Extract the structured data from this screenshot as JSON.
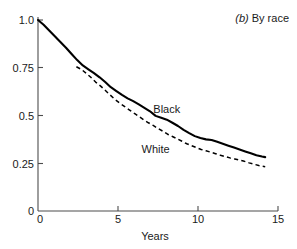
{
  "chart_data": {
    "type": "line",
    "title_prefix": "(b)",
    "title_text": "By race",
    "xlabel": "Years",
    "ylabel": "",
    "xlim": [
      0,
      15
    ],
    "ylim": [
      0,
      1.0
    ],
    "xticks": [
      0,
      5,
      10,
      15
    ],
    "xticklabels": [
      "0",
      "5",
      "10",
      "15"
    ],
    "yticks": [
      0,
      0.25,
      0.5,
      0.75,
      1.0
    ],
    "yticklabels": [
      "0",
      "0.25",
      "0.5",
      "0.75",
      "1.0"
    ],
    "grid": false,
    "legend_position": "inline-annotation",
    "series": [
      {
        "name": "Black",
        "style": "solid",
        "color": "#000000",
        "label_x": 8.05,
        "label_y": 0.512,
        "x": [
          0.0,
          0.35,
          0.7,
          1.05,
          1.4,
          1.75,
          2.1,
          2.45,
          2.8,
          3.15,
          3.5,
          3.85,
          4.2,
          4.55,
          4.9,
          5.25,
          5.6,
          5.95,
          6.3,
          6.65,
          7.0,
          7.35,
          7.7,
          8.05,
          8.4,
          8.75,
          9.1,
          9.45,
          9.8,
          10.15,
          10.5,
          10.85,
          11.2,
          11.55,
          11.9,
          12.25,
          12.6,
          12.95,
          13.3,
          13.65,
          14.0,
          14.2
        ],
        "y": [
          1.0,
          0.975,
          0.945,
          0.915,
          0.885,
          0.855,
          0.822,
          0.79,
          0.762,
          0.742,
          0.722,
          0.7,
          0.675,
          0.648,
          0.628,
          0.608,
          0.59,
          0.575,
          0.558,
          0.54,
          0.522,
          0.498,
          0.488,
          0.478,
          0.462,
          0.445,
          0.425,
          0.408,
          0.392,
          0.382,
          0.375,
          0.372,
          0.362,
          0.352,
          0.342,
          0.332,
          0.322,
          0.312,
          0.302,
          0.292,
          0.285,
          0.282
        ]
      },
      {
        "name": "White",
        "style": "dashed",
        "color": "#000000",
        "label_x": 7.35,
        "label_y": 0.305,
        "x": [
          2.4,
          2.7,
          3.0,
          3.3,
          3.6,
          3.9,
          4.2,
          4.5,
          4.8,
          5.1,
          5.4,
          5.7,
          6.0,
          6.3,
          6.6,
          6.9,
          7.2,
          7.5,
          7.8,
          8.1,
          8.4,
          8.7,
          9.0,
          9.3,
          9.6,
          9.9,
          10.2,
          10.5,
          10.8,
          11.1,
          11.4,
          11.7,
          12.0,
          12.3,
          12.6,
          12.9,
          13.2,
          13.5,
          13.8,
          14.2
        ],
        "y": [
          0.755,
          0.742,
          0.722,
          0.7,
          0.675,
          0.655,
          0.632,
          0.608,
          0.585,
          0.565,
          0.548,
          0.53,
          0.512,
          0.495,
          0.478,
          0.462,
          0.448,
          0.432,
          0.418,
          0.402,
          0.39,
          0.378,
          0.365,
          0.352,
          0.342,
          0.332,
          0.322,
          0.315,
          0.308,
          0.3,
          0.292,
          0.285,
          0.278,
          0.272,
          0.266,
          0.26,
          0.252,
          0.245,
          0.238,
          0.232
        ]
      }
    ]
  }
}
